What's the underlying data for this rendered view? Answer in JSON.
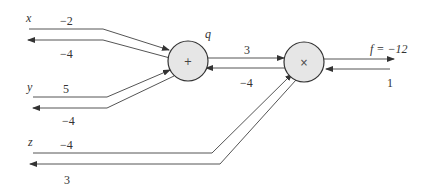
{
  "diagram": {
    "type": "computational-graph",
    "inputs": [
      {
        "name": "x",
        "forward": "−2",
        "gradient": "−4"
      },
      {
        "name": "y",
        "forward": "5",
        "gradient": "−4"
      },
      {
        "name": "z",
        "forward": "−4",
        "gradient": "3"
      }
    ],
    "nodes": [
      {
        "id": "add",
        "op": "+",
        "label": "q",
        "forward": "3",
        "gradient": "−4"
      },
      {
        "id": "mul",
        "op": "×",
        "label": "",
        "forward": "f = −12",
        "gradient": "1"
      }
    ],
    "output": {
      "name": "f",
      "value": "−12",
      "gradient": "1"
    },
    "colors": {
      "wire": "#555555",
      "node_fill": "#e6e6e6",
      "node_stroke": "#333333"
    }
  }
}
